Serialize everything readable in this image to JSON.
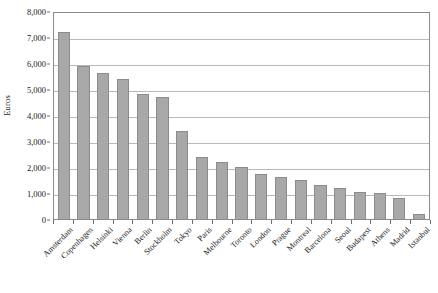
{
  "chart_data": {
    "type": "bar",
    "title": "",
    "xlabel": "",
    "ylabel": "Euros",
    "ylim": [
      0,
      8000
    ],
    "ytick_labels": [
      "0",
      "1,000",
      "2,000",
      "3,000",
      "4,000",
      "5,000",
      "6,000",
      "7,000",
      "8,000"
    ],
    "ytick_values": [
      0,
      1000,
      2000,
      3000,
      4000,
      5000,
      6000,
      7000,
      8000
    ],
    "grid": true,
    "legend": false,
    "legend_position": "none",
    "bar_color": "#a8a8a8",
    "bar_edge_color": "#8c8c8c",
    "gridline_color": "#b9b9b9",
    "frame_color": "#8a8a8a",
    "categories": [
      "Amsterdam",
      "Copenhagen",
      "Helsinki",
      "Vienna",
      "Berlin",
      "Stockholm",
      "Tokyo",
      "Paris",
      "Melbourne",
      "Toronto",
      "London",
      "Prague",
      "Montreal",
      "Barcelona",
      "Seoul",
      "Budapest",
      "Athens",
      "Madrid",
      "Istanbul"
    ],
    "values": [
      7200,
      5900,
      5600,
      5400,
      4800,
      4700,
      3400,
      2400,
      2200,
      2000,
      1750,
      1600,
      1500,
      1300,
      1200,
      1050,
      1000,
      800,
      200
    ]
  }
}
